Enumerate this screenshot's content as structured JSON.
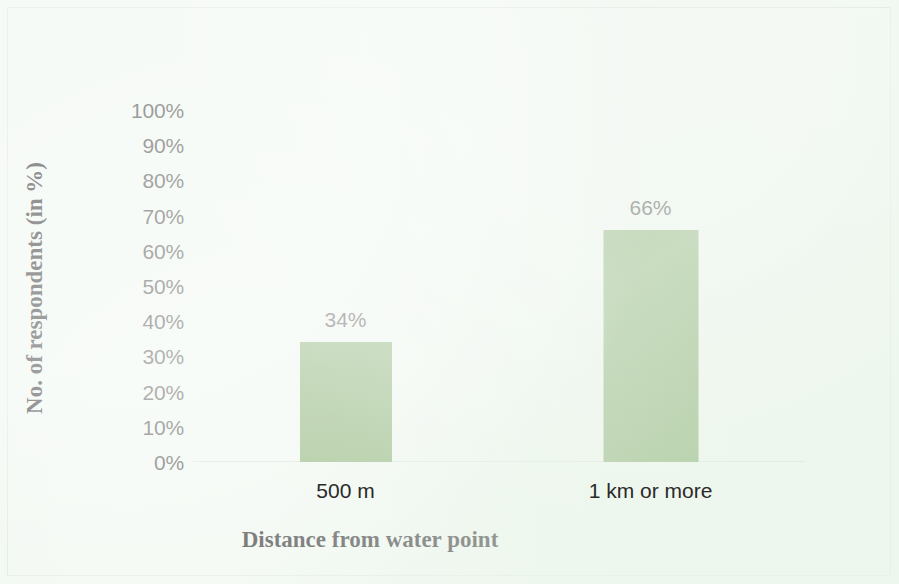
{
  "chart_data": {
    "type": "bar",
    "title": "",
    "subtitle": "",
    "xlabel": "Distance from water point",
    "ylabel": "No. of respondents (in %)",
    "categories": [
      "500 m",
      "1 km or more"
    ],
    "values": [
      34,
      66
    ],
    "data_labels": [
      "34%",
      "66%"
    ],
    "ylim": [
      0,
      100
    ],
    "ytick_step": 10,
    "ytick_labels": [
      "100%",
      "90%",
      "80%",
      "70%",
      "60%",
      "50%",
      "40%",
      "30%",
      "20%",
      "10%",
      "0%"
    ],
    "ytick_values": [
      100,
      90,
      80,
      70,
      60,
      50,
      40,
      30,
      20,
      10,
      0
    ],
    "grid": false,
    "legend": false,
    "legend_position": "none",
    "series": [
      {
        "name": "No. of respondents",
        "values": [
          34,
          66
        ],
        "color": "#6f9f54"
      }
    ],
    "colors": {
      "bar": "#6f9f54",
      "background": "#eef7ee",
      "axis_text": "#2a2a2a",
      "axis_title": "#141414",
      "baseline": "#d6ddd6",
      "frame": "#dfe9df"
    }
  }
}
